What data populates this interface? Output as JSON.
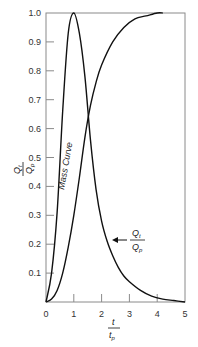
{
  "chart_data": {
    "type": "line",
    "title": "",
    "xlabel": "t / t_p",
    "ylabel": "Q_t / Q_p",
    "xlim": [
      0,
      5
    ],
    "ylim": [
      0,
      1.0
    ],
    "grid": false,
    "legend": null,
    "x_ticks": [
      "0",
      "1",
      "2",
      "3",
      "4",
      "5"
    ],
    "y_ticks": [
      "0.1",
      "0.2",
      "0.3",
      "0.4",
      "0.5",
      "0.6",
      "0.7",
      "0.8",
      "0.9",
      "1.0"
    ],
    "series": [
      {
        "name": "Q_t / Q_p (dimensionless unit hydrograph)",
        "x": [
          0,
          0.2,
          0.4,
          0.6,
          0.8,
          1.0,
          1.2,
          1.4,
          1.6,
          1.8,
          2.0,
          2.2,
          2.4,
          2.6,
          2.8,
          3.0,
          3.4,
          3.8,
          4.2,
          4.6,
          5.0
        ],
        "y": [
          0,
          0.1,
          0.31,
          0.66,
          0.93,
          1.0,
          0.93,
          0.78,
          0.56,
          0.39,
          0.28,
          0.21,
          0.16,
          0.12,
          0.09,
          0.07,
          0.04,
          0.02,
          0.01,
          0.005,
          0
        ]
      },
      {
        "name": "Mass Curve",
        "x": [
          0,
          0.2,
          0.4,
          0.6,
          0.8,
          1.0,
          1.2,
          1.4,
          1.6,
          1.8,
          2.0,
          2.4,
          2.8,
          3.2,
          3.6,
          4.0,
          4.2
        ],
        "y": [
          0,
          0.01,
          0.04,
          0.1,
          0.19,
          0.3,
          0.43,
          0.57,
          0.68,
          0.76,
          0.82,
          0.9,
          0.95,
          0.98,
          0.99,
          1.0,
          1.0
        ]
      }
    ],
    "annotations": [
      {
        "text": "Mass Curve",
        "rotation": -80,
        "x": 0.55,
        "y": 0.45
      },
      {
        "text": "Q_t / Q_p",
        "arrow_to": [
          2.4,
          0.21
        ]
      }
    ]
  },
  "labels": {
    "mass_curve": "Mass Curve",
    "q_num": "Q",
    "q_num_sub": "t",
    "q_den": "Q",
    "q_den_sub": "p",
    "x_num": "t",
    "x_den": "t",
    "x_den_sub": "p"
  }
}
